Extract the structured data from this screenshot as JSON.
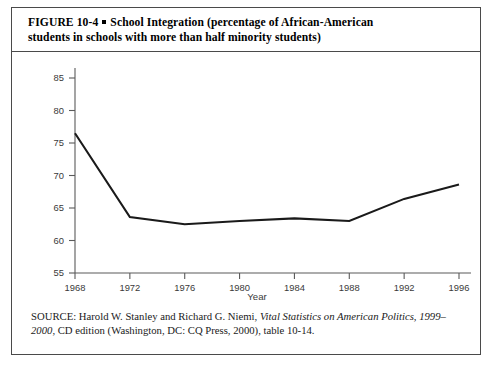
{
  "figure": {
    "label": "FIGURE 10-4",
    "marker": "■",
    "title_line1": "School Integration (percentage of African-American",
    "title_line2": "students in schools with more than half minority students)"
  },
  "source": {
    "prefix": "SOURCE: Harold W. Stanley and Richard G. Niemi, ",
    "italic1": "Vital Statistics on American Politics, 1999–",
    "italic2": "2000",
    "suffix": ", CD edition (Washington, DC: CQ Press, 2000), table 10-14."
  },
  "chart_data": {
    "type": "line",
    "title": "",
    "xlabel": "Year",
    "ylabel": "",
    "x": [
      1968,
      1972,
      1976,
      1980,
      1984,
      1988,
      1992,
      1996
    ],
    "values": [
      76.5,
      63.6,
      62.5,
      63.0,
      63.4,
      63.0,
      66.4,
      68.6
    ],
    "xticks": [
      "1968",
      "1972",
      "1976",
      "1980",
      "1984",
      "1988",
      "1992",
      "1996"
    ],
    "yticks": [
      "55",
      "60",
      "65",
      "70",
      "75",
      "80",
      "85"
    ],
    "xlim": [
      1968,
      1996
    ],
    "ylim": [
      55,
      85
    ],
    "grid": false,
    "legend": null,
    "line_color": "#1a1a1a"
  }
}
